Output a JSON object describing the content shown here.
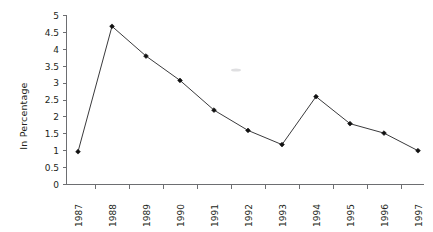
{
  "chart_data": {
    "type": "line",
    "title": "",
    "subtitle": "",
    "xlabel": "",
    "ylabel": "In Percentage",
    "categories": [
      "1987",
      "1988",
      "1989",
      "1990",
      "1991",
      "1992",
      "1993",
      "1994",
      "1995",
      "1996",
      "1997"
    ],
    "values": [
      0.97,
      4.68,
      3.8,
      3.08,
      2.2,
      1.6,
      1.18,
      2.6,
      1.8,
      1.52,
      1.0
    ],
    "series": [
      {
        "name": "In Percentage",
        "values": [
          0.97,
          4.68,
          3.8,
          3.08,
          2.2,
          1.6,
          1.18,
          2.6,
          1.8,
          1.52,
          1.0
        ]
      }
    ],
    "ylim": [
      0,
      5
    ],
    "ytick_values": [
      0,
      0.5,
      1,
      1.5,
      2,
      2.5,
      3,
      3.5,
      4,
      4.5,
      5
    ],
    "ytick_labels": [
      "0",
      "0.5",
      "1",
      "1.5",
      "2",
      "2.5",
      "3",
      "3.5",
      "4",
      "4.5",
      "5"
    ],
    "xtick_labels": [
      "1987",
      "1988",
      "1989",
      "1990",
      "1991",
      "1992",
      "1993",
      "1994",
      "1995",
      "1996",
      "1997"
    ],
    "xtick_label_rotation": 90,
    "grid": false,
    "legend": false,
    "legend_position": "none",
    "marker": "diamond",
    "line_color": "#3a3a3c",
    "marker_color": "#111111",
    "axis_color": "#6d6e71",
    "background_color": "#ffffff",
    "annotations": []
  },
  "axes": {
    "y_title": "In Percentage",
    "y_labels": [
      "5",
      "4.5",
      "4",
      "3.5",
      "3",
      "2.5",
      "2",
      "1.5",
      "1",
      "0.5",
      "0"
    ],
    "x_labels": [
      "1987",
      "1988",
      "1989",
      "1990",
      "1991",
      "1992",
      "1993",
      "1994",
      "1995",
      "1996",
      "1997"
    ]
  }
}
